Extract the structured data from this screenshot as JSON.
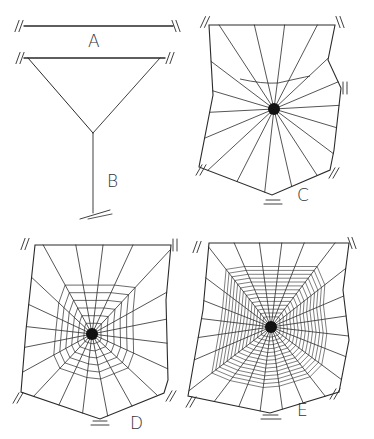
{
  "figure": {
    "panels": [
      {
        "id": "A",
        "label": "A",
        "stage": "bridge line"
      },
      {
        "id": "B",
        "label": "B",
        "stage": "Y-frame with anchor line"
      },
      {
        "id": "C",
        "label": "C",
        "stage": "frame and radii"
      },
      {
        "id": "D",
        "label": "D",
        "stage": "auxiliary spiral"
      },
      {
        "id": "E",
        "label": "E",
        "stage": "capture spiral"
      }
    ]
  },
  "colors": {
    "line": "#2a2a2a",
    "background": "#ffffff",
    "hub": "#111111"
  }
}
